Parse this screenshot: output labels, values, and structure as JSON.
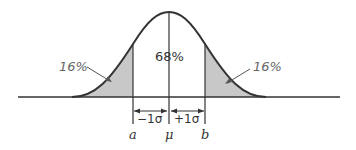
{
  "diagram": {
    "center_label": "68%",
    "left_tail_label": "16%",
    "right_tail_label": "16%",
    "minus_sigma_label": "−1σ",
    "plus_sigma_label": "+1σ",
    "a_label": "a",
    "mu_label": "μ",
    "b_label": "b",
    "shade_color": "#c8c8c8",
    "line_color": "#333333"
  }
}
